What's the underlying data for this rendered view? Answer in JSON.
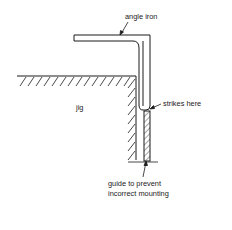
{
  "diagram": {
    "colors": {
      "ink": "#1a1a1a",
      "background": "#ffffff"
    },
    "labels": {
      "angle_iron": "angle iron",
      "jig": "jig",
      "strikes_here": "strikes here",
      "guide_line1": "guide to prevent",
      "guide_line2": "incorrect mounting"
    },
    "components": [
      {
        "id": "angle-iron",
        "label": "angle iron"
      },
      {
        "id": "jig",
        "label": "jig"
      },
      {
        "id": "strike-point",
        "label": "strikes here"
      },
      {
        "id": "guide",
        "label": "guide to prevent incorrect mounting"
      }
    ]
  }
}
